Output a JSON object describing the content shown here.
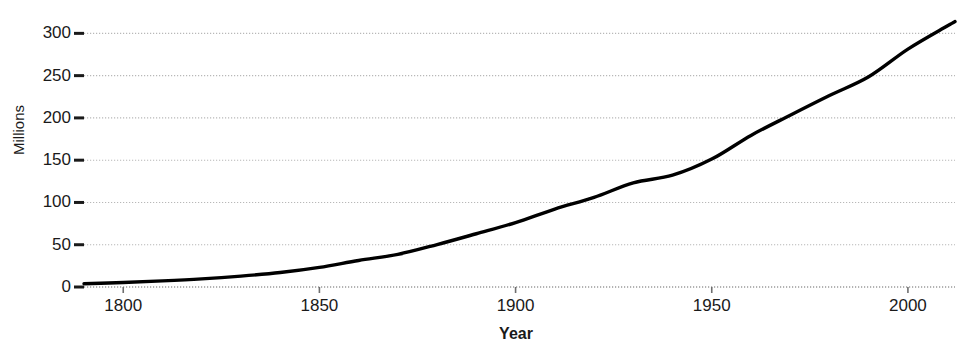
{
  "chart_data": {
    "type": "line",
    "title": "",
    "xlabel": "Year",
    "ylabel": "Millions",
    "xlim": [
      1790,
      2012
    ],
    "ylim": [
      0,
      330
    ],
    "grid": true,
    "grid_style": "dotted-horizontal",
    "legend": "none",
    "line_color": "#000000",
    "line_width": 3.4,
    "x_ticks": [
      1800,
      1850,
      1900,
      1950,
      2000
    ],
    "x_tick_labels": [
      "1800",
      "1850",
      "1900",
      "1950",
      "2000"
    ],
    "y_ticks": [
      0,
      50,
      100,
      150,
      200,
      250,
      300
    ],
    "y_tick_labels": [
      "0",
      "50",
      "100",
      "150",
      "200",
      "250",
      "300"
    ],
    "series": [
      {
        "name": "Population",
        "x": [
          1790,
          1800,
          1810,
          1820,
          1830,
          1840,
          1850,
          1860,
          1870,
          1880,
          1890,
          1900,
          1910,
          1920,
          1930,
          1940,
          1950,
          1960,
          1970,
          1980,
          1990,
          2000,
          2010,
          2012
        ],
        "values": [
          3.9,
          5.3,
          7.2,
          9.6,
          12.9,
          17.1,
          23.2,
          31.4,
          38.6,
          50.2,
          63.0,
          76.2,
          92.2,
          106.0,
          123.2,
          132.2,
          151.3,
          179.3,
          203.2,
          226.5,
          248.7,
          281.4,
          308.7,
          314.0
        ]
      }
    ]
  },
  "axis": {
    "y_title": "Millions",
    "x_title": "Year"
  }
}
